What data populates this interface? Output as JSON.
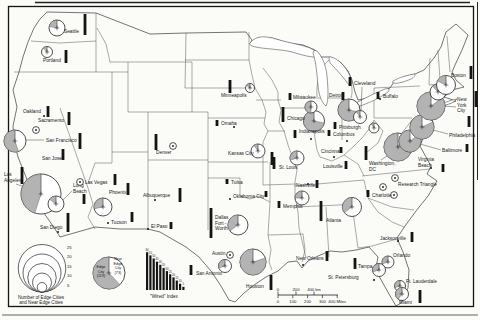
{
  "figure": {
    "paper": "#fbfbf8",
    "ink": "#141414",
    "line": "#3a3a3a",
    "gray": "#b3b3b3"
  },
  "legend": {
    "size": {
      "values": [
        25,
        20,
        15,
        10,
        5
      ],
      "caption_lines": [
        "Number of Edge Cities",
        "and Near Edge Cities"
      ]
    },
    "pie": {
      "edge_lines": [
        "Edge",
        "City",
        "(119)"
      ],
      "near_lines": [
        "Near",
        "Edge",
        "City",
        "(73)"
      ],
      "edge_fraction": 0.62
    },
    "wired": {
      "caption": "\"Wired\" Index",
      "values": [
        60,
        55,
        50,
        45,
        40,
        35,
        30,
        25,
        20,
        15,
        10,
        5
      ]
    },
    "scale": {
      "km_labels": [
        "0",
        "200",
        "400 km"
      ],
      "miles_labels": [
        "0",
        "100",
        "200",
        "300",
        "400 Miles"
      ]
    }
  },
  "cities": [
    {
      "name": "Seattle",
      "lines": [
        "Seattle"
      ],
      "label": [
        64,
        33
      ],
      "bar": [
        85,
        14,
        21
      ],
      "circle": [
        57,
        28,
        8,
        0.22
      ]
    },
    {
      "name": "Portland",
      "lines": [
        "Portland"
      ],
      "label": [
        43,
        62
      ],
      "bar": [
        66,
        50,
        13
      ],
      "circle": [
        47,
        52,
        5.5,
        0.12
      ]
    },
    {
      "name": "Oakland",
      "lines": [
        "Oakland"
      ],
      "label": [
        23,
        113
      ],
      "bar": [
        48,
        106,
        11
      ],
      "pt": [
        44,
        116
      ]
    },
    {
      "name": "Sacramento",
      "lines": [
        "Sacramento"
      ],
      "label": [
        38,
        122
      ],
      "bar": [
        69,
        112,
        13
      ],
      "dots": [
        [
          36,
          130
        ]
      ]
    },
    {
      "name": "San Francisco",
      "lines": [
        "San Francisco"
      ],
      "label": [
        46,
        142
      ],
      "bar": [
        80,
        133,
        16
      ],
      "circle": [
        15,
        141,
        11,
        0.55
      ],
      "leader": [
        44,
        140,
        26,
        140
      ]
    },
    {
      "name": "San Jose",
      "lines": [
        "San Jose"
      ],
      "label": [
        42,
        160
      ],
      "bar": [
        63,
        149,
        11
      ]
    },
    {
      "name": "Los Angeles",
      "lines": [
        "Los",
        "Angeles"
      ],
      "label": [
        4,
        176
      ],
      "bar": [
        22,
        167,
        17
      ],
      "circle": [
        41,
        194,
        20,
        0.45
      ],
      "leader": [
        16,
        184,
        30,
        189
      ]
    },
    {
      "name": "Long Beach",
      "lines": [
        "Long",
        "Beach"
      ],
      "label": [
        73,
        187
      ],
      "bar": [
        84,
        194,
        10
      ],
      "circle": [
        56,
        204,
        8,
        0.15
      ],
      "leader": [
        72,
        191,
        63,
        200
      ]
    },
    {
      "name": "San Diego",
      "lines": [
        "San Diego"
      ],
      "label": [
        40,
        229
      ],
      "bar": [
        68,
        213,
        19
      ],
      "pt": [
        58,
        232
      ]
    },
    {
      "name": "Las Vegas",
      "lines": [
        "Las Vegas"
      ],
      "label": [
        85,
        184
      ],
      "bar": [
        115,
        174,
        11
      ],
      "dots": [
        [
          80,
          182
        ]
      ]
    },
    {
      "name": "Phoenix",
      "lines": [
        "Phoenix"
      ],
      "label": [
        109,
        194
      ],
      "bar": [
        128,
        183,
        12
      ],
      "circle": [
        103,
        207,
        9,
        0.28
      ]
    },
    {
      "name": "Tucson",
      "lines": [
        "Tucson"
      ],
      "label": [
        111,
        224
      ],
      "bar": [
        132,
        212,
        10
      ],
      "pt": [
        108,
        223
      ]
    },
    {
      "name": "Albuquerque",
      "lines": [
        "Albuquerque"
      ],
      "label": [
        143,
        197
      ],
      "bar": [
        180,
        188,
        14
      ],
      "pt": [
        155,
        200
      ]
    },
    {
      "name": "El Paso",
      "lines": [
        "El Paso"
      ],
      "label": [
        151,
        228
      ],
      "bar": [
        171,
        222,
        7
      ],
      "pt": [
        148,
        229
      ]
    },
    {
      "name": "Denver",
      "lines": [
        "Denver"
      ],
      "label": [
        156,
        154
      ],
      "bar": [
        156,
        134,
        16
      ],
      "dots": [
        [
          173,
          146
        ]
      ]
    },
    {
      "name": "Minneapolis",
      "lines": [
        "Minneapolis"
      ],
      "label": [
        221,
        97
      ],
      "bar": [
        230,
        80,
        13
      ],
      "circle": [
        250,
        88,
        4.5,
        0.15
      ]
    },
    {
      "name": "Omaha",
      "lines": [
        "Omaha"
      ],
      "label": [
        221,
        125
      ],
      "bar": [
        217,
        120,
        6
      ],
      "pt": [
        234,
        127
      ]
    },
    {
      "name": "Kansas City",
      "lines": [
        "Kansas City"
      ],
      "label": [
        228,
        155
      ],
      "bar": [
        272,
        152,
        13
      ],
      "circle": [
        258,
        151,
        7,
        0.1
      ]
    },
    {
      "name": "Tulsa",
      "lines": [
        "Tulsa"
      ],
      "label": [
        231,
        184
      ],
      "bar": [
        227,
        179,
        5
      ]
    },
    {
      "name": "Oklahoma City",
      "lines": [
        "Oklahoma City"
      ],
      "label": [
        233,
        198
      ],
      "bar": [
        266,
        191,
        6
      ],
      "pt": [
        230,
        199
      ]
    },
    {
      "name": "St. Louis",
      "lines": [
        "St. Louis"
      ],
      "label": [
        279,
        169
      ],
      "bar": [
        274,
        157,
        12
      ],
      "circle": [
        297,
        158,
        7,
        0.3
      ]
    },
    {
      "name": "Memphis",
      "lines": [
        "Memphis"
      ],
      "label": [
        283,
        208
      ],
      "bar": [
        279,
        201,
        7
      ],
      "circle": [
        302,
        198,
        7,
        0.25
      ]
    },
    {
      "name": "Chicago",
      "lines": [
        "Chicago"
      ],
      "label": [
        287,
        120
      ],
      "bar": [
        283,
        107,
        15
      ],
      "circle": [
        314,
        121,
        10.5,
        0.72
      ]
    },
    {
      "name": "Milwaukee",
      "lines": [
        "Milwaukee"
      ],
      "label": [
        293,
        99
      ],
      "bar": [
        290,
        93,
        7
      ],
      "circle": [
        311,
        107,
        6,
        0.5
      ]
    },
    {
      "name": "Detroit",
      "lines": [
        "Detroit"
      ],
      "label": [
        329,
        97
      ],
      "bar": [
        343,
        92,
        8
      ],
      "circle": [
        349,
        110,
        11,
        0.72
      ]
    },
    {
      "name": "Cleveland",
      "lines": [
        "Cleveland"
      ],
      "label": [
        354,
        85
      ],
      "bar": [
        350,
        77,
        9
      ],
      "circle": [
        360,
        117,
        6.5,
        0.1
      ],
      "leader": [
        362,
        87,
        361,
        111
      ]
    },
    {
      "name": "Buffalo",
      "lines": [
        "Buffalo"
      ],
      "label": [
        383,
        98
      ],
      "bar": [
        378,
        92,
        7
      ],
      "pt": [
        380,
        99
      ]
    },
    {
      "name": "Pittsburgh",
      "lines": [
        "Pittsburgh"
      ],
      "label": [
        339,
        129
      ],
      "bar": [
        335,
        122,
        7
      ],
      "circle": [
        374,
        128,
        5,
        0.1
      ]
    },
    {
      "name": "Columbus",
      "lines": [
        "Columbus"
      ],
      "label": [
        333,
        136
      ],
      "bar": [
        329,
        130,
        6
      ],
      "pt": [
        347,
        141
      ]
    },
    {
      "name": "Indianapolis",
      "lines": [
        "Indianapolis"
      ],
      "label": [
        299,
        133
      ],
      "bar": [
        295,
        130,
        8
      ],
      "pt": [
        311,
        139
      ]
    },
    {
      "name": "Cincinnati",
      "lines": [
        "Cincinnati"
      ],
      "label": [
        321,
        153
      ],
      "bar": [
        341,
        147,
        6
      ],
      "pt": [
        334,
        157
      ]
    },
    {
      "name": "Louisville",
      "lines": [
        "Louisville"
      ],
      "label": [
        323,
        168
      ],
      "bar": [
        346,
        161,
        8
      ]
    },
    {
      "name": "Nashville",
      "lines": [
        "Nashville"
      ],
      "label": [
        296,
        187
      ],
      "bar": [
        317,
        180,
        8
      ],
      "pt": [
        308,
        184
      ]
    },
    {
      "name": "Atlanta",
      "lines": [
        "Atlanta"
      ],
      "label": [
        326,
        222
      ],
      "bar": [
        321,
        201,
        20
      ],
      "circle": [
        352,
        207,
        9.5,
        0.35
      ]
    },
    {
      "name": "Charlotte",
      "lines": [
        "Charlotte"
      ],
      "label": [
        372,
        197
      ],
      "bar": [
        368,
        190,
        7
      ],
      "dots": [
        [
          394,
          195
        ]
      ]
    },
    {
      "name": "Research Triangle",
      "lines": [
        "Research Triangle"
      ],
      "label": [
        398,
        186
      ],
      "dots": [
        [
          383,
          187
        ],
        [
          395,
          178
        ]
      ]
    },
    {
      "name": "Washington, DC",
      "lines": [
        "Washington,",
        "DC"
      ],
      "label": [
        369,
        165
      ],
      "bar": [
        366,
        146,
        14
      ],
      "circle": [
        398,
        147,
        14,
        0.88
      ],
      "leader": [
        381,
        160,
        390,
        154
      ]
    },
    {
      "name": "Baltimore",
      "lines": [
        "Baltimore"
      ],
      "label": [
        442,
        152
      ],
      "bar": [
        467,
        144,
        8
      ],
      "circle": [
        410,
        141,
        11,
        0.85
      ],
      "leader": [
        441,
        150,
        420,
        144
      ]
    },
    {
      "name": "Philadelphia",
      "lines": [
        "Philadelphia"
      ],
      "label": [
        449,
        137
      ],
      "bar": [
        469,
        116,
        11
      ],
      "circle": [
        422,
        127,
        12,
        0.82
      ],
      "leader": [
        448,
        134,
        433,
        130
      ]
    },
    {
      "name": "New York City",
      "lines": [
        "New",
        "York",
        "City"
      ],
      "label": [
        457,
        101
      ],
      "bar": [
        476,
        91,
        16
      ],
      "circle": [
        431,
        106,
        14,
        0.85
      ],
      "leader": [
        456,
        107,
        444,
        106
      ]
    },
    {
      "name": "",
      "lines": [],
      "circle": [
        438,
        92,
        8,
        0.12
      ]
    },
    {
      "name": "Boston",
      "lines": [
        "Boston"
      ],
      "label": [
        451,
        77
      ],
      "bar": [
        471,
        66,
        13
      ],
      "circle": [
        446,
        85,
        9.5,
        0.18
      ]
    },
    {
      "name": "Virginia Beach",
      "lines": [
        "Virginia",
        "Beach"
      ],
      "label": [
        418,
        161
      ],
      "bar": [
        443,
        164,
        8
      ],
      "pt": [
        431,
        168
      ]
    },
    {
      "name": "Jacksonville",
      "lines": [
        "Jacksonville"
      ],
      "label": [
        380,
        240
      ],
      "bar": [
        412,
        232,
        10
      ],
      "pt": [
        398,
        241
      ]
    },
    {
      "name": "Orlando",
      "lines": [
        "Orlando"
      ],
      "label": [
        393,
        257
      ],
      "circle": [
        388,
        262,
        6,
        0.3
      ]
    },
    {
      "name": "Tampa",
      "lines": [
        "Tampa"
      ],
      "label": [
        358,
        268
      ],
      "bar": [
        355,
        258,
        11
      ],
      "circle": [
        379,
        270,
        6.5,
        0.3
      ]
    },
    {
      "name": "St. Petersburg",
      "lines": [
        "St. Petersburg"
      ],
      "label": [
        328,
        279
      ],
      "pt": [
        374,
        280
      ]
    },
    {
      "name": "Ft. Lauderdale",
      "lines": [
        "Ft. Lauderdale"
      ],
      "label": [
        406,
        283
      ],
      "circle": [
        400,
        286,
        5.5,
        0.3
      ]
    },
    {
      "name": "Miami",
      "lines": [
        "Miami"
      ],
      "label": [
        399,
        304
      ],
      "bar": [
        420,
        290,
        13
      ],
      "circle": [
        402,
        294,
        6.5,
        0.4
      ]
    },
    {
      "name": "Houston",
      "lines": [
        "Houston"
      ],
      "label": [
        246,
        288
      ],
      "bar": [
        271,
        275,
        15
      ],
      "circle": [
        253,
        262,
        13,
        0.8
      ]
    },
    {
      "name": "Dallas-Fort Worth",
      "lines": [
        "Dallas",
        "Fort -",
        "Worth"
      ],
      "label": [
        215,
        219
      ],
      "bar": [
        211,
        208,
        30
      ],
      "circle": [
        238,
        225,
        10,
        0.35
      ]
    },
    {
      "name": "Austin",
      "lines": [
        "Austin"
      ],
      "label": [
        212,
        255
      ],
      "dots": [
        [
          230,
          255
        ]
      ],
      "circle": [
        225,
        266,
        6.5,
        0.3
      ]
    },
    {
      "name": "San Antonio",
      "lines": [
        "San Antonio"
      ],
      "label": [
        196,
        275
      ],
      "bar": [
        191,
        265,
        10
      ]
    },
    {
      "name": "New Orleans",
      "lines": [
        "New Orleans"
      ],
      "label": [
        296,
        260
      ],
      "bar": [
        327,
        251,
        10
      ],
      "pt": [
        303,
        265
      ]
    }
  ]
}
